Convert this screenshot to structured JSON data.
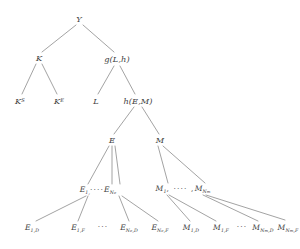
{
  "figure": {
    "type": "tree-diagram",
    "edge_color": "#8c8c8c",
    "text_color": "#3d3d3d",
    "background": "#ffffff"
  },
  "nodes": {
    "root": {
      "label": "Y",
      "x": 79,
      "y": 19
    },
    "k": {
      "label": "K",
      "x": 39,
      "y": 58
    },
    "g": {
      "label": "g(L,h)",
      "x": 117,
      "y": 59
    },
    "ks": {
      "base": "K",
      "sup": "S",
      "x": 20,
      "y": 101
    },
    "ke": {
      "base": "K",
      "sup": "E",
      "x": 59,
      "y": 101
    },
    "l": {
      "label": "L",
      "x": 96,
      "y": 101
    },
    "h": {
      "label": "h(E,M)",
      "x": 138,
      "y": 101
    },
    "e": {
      "label": "E",
      "x": 112,
      "y": 140
    },
    "m": {
      "label": "M",
      "x": 160,
      "y": 140
    },
    "e_list": {
      "first_base": "E",
      "first_sub": "1,",
      "dots": "····",
      "last_base": "E",
      "last_sub": "N",
      "last_subsub": "e",
      "x": 98,
      "y": 190
    },
    "m_list": {
      "first_base": "M",
      "first_sub": "1",
      "dots": ", ···· ,",
      "last_base": "M",
      "last_sub": "N",
      "last_subsub": "m",
      "x": 183,
      "y": 189
    },
    "leaves_e": [
      {
        "base": "E",
        "sub": "1,D",
        "x": 32,
        "y": 228
      },
      {
        "base": "E",
        "sub": "1,F",
        "x": 78,
        "y": 228
      },
      {
        "dots": "···",
        "x": 103,
        "y": 227
      },
      {
        "base": "E",
        "sub": "N",
        "subsub": "e",
        "subtail": ",D",
        "x": 129,
        "y": 228
      },
      {
        "base": "E",
        "sub": "N",
        "subsub": "e",
        "subtail": ",F",
        "x": 160,
        "y": 228
      }
    ],
    "leaves_m": [
      {
        "base": "M",
        "sub": "1,D",
        "x": 191,
        "y": 228
      },
      {
        "base": "M",
        "sub": "1,F",
        "x": 221,
        "y": 228
      },
      {
        "dots": "···",
        "x": 242,
        "y": 227
      },
      {
        "base": "M",
        "sub": "N",
        "subsub": "m",
        "subtail": ",D",
        "x": 263,
        "y": 228
      },
      {
        "base": "M",
        "sub": "N",
        "subsub": "m",
        "subtail": ",F",
        "x": 288,
        "y": 228
      }
    ]
  }
}
